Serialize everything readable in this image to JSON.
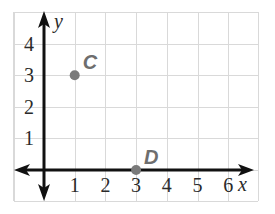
{
  "chart_data": {
    "type": "scatter",
    "title": "",
    "xlabel": "x",
    "ylabel": "y",
    "xlim": [
      -1,
      7
    ],
    "ylim": [
      -1,
      5
    ],
    "x_ticks": [
      1,
      2,
      3,
      4,
      5,
      6
    ],
    "y_ticks": [
      1,
      2,
      3,
      4
    ],
    "x_tick_labels": [
      "1",
      "2",
      "3",
      "4",
      "5",
      "6"
    ],
    "y_tick_labels": [
      "1",
      "2",
      "3",
      "4"
    ],
    "grid": true,
    "legend": null,
    "points": [
      {
        "label": "C",
        "x": 1,
        "y": 3
      },
      {
        "label": "D",
        "x": 3,
        "y": 0
      }
    ],
    "colors": {
      "grid": "#d9d9d9",
      "axis": "#111111",
      "point": "#7a7a7a",
      "point_label": "#6e6e6e",
      "tick_text": "#2a2a2a"
    }
  }
}
